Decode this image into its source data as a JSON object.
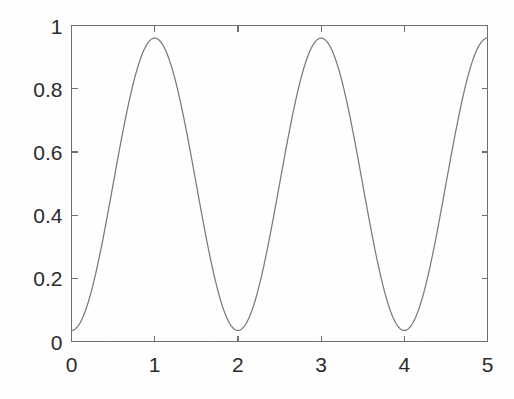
{
  "figure": {
    "background_color": "#fefefe",
    "axes_color": "#6f6f6f",
    "curve_color": "#7a7a7a",
    "label_color": "#2b2b2b"
  },
  "chart_data": {
    "type": "line",
    "title": "",
    "subtitle": "",
    "xlabel": "",
    "ylabel": "",
    "xlim": [
      0,
      5
    ],
    "ylim": [
      0,
      1
    ],
    "grid": false,
    "legend": null,
    "xticks": [
      0,
      1,
      2,
      3,
      4,
      5
    ],
    "xticklabels": [
      "0",
      "1",
      "2",
      "3",
      "4",
      "5"
    ],
    "yticks": [
      0,
      0.2,
      0.4,
      0.6,
      0.8,
      1
    ],
    "yticklabels": [
      "0",
      "0.2",
      "0.4",
      "0.6",
      "0.8",
      "1"
    ],
    "series": [
      {
        "name": "waveform",
        "color": "#7a7a7a",
        "linewidth": 1,
        "formula": "0.4975 - 0.4625*cos(pi*x)",
        "x": [
          0,
          0.1,
          0.2,
          0.3,
          0.4,
          0.5,
          0.6,
          0.7,
          0.8,
          0.9,
          1,
          1.1,
          1.2,
          1.3,
          1.4,
          1.5,
          1.6,
          1.7,
          1.8,
          1.9,
          2,
          2.1,
          2.2,
          2.3,
          2.4,
          2.5,
          2.6,
          2.7,
          2.8,
          2.9,
          3,
          3.1,
          3.2,
          3.3,
          3.4,
          3.5,
          3.6,
          3.7,
          3.8,
          3.9,
          4,
          4.1,
          4.2,
          4.3,
          4.4,
          4.5,
          4.6,
          4.7,
          4.8,
          4.9,
          5
        ],
        "y": [
          0.035,
          0.058,
          0.126,
          0.234,
          0.354,
          0.498,
          0.641,
          0.761,
          0.869,
          0.937,
          0.96,
          0.937,
          0.869,
          0.761,
          0.641,
          0.498,
          0.354,
          0.234,
          0.126,
          0.058,
          0.035,
          0.058,
          0.126,
          0.234,
          0.354,
          0.498,
          0.641,
          0.761,
          0.869,
          0.937,
          0.96,
          0.937,
          0.869,
          0.761,
          0.641,
          0.498,
          0.354,
          0.234,
          0.126,
          0.058,
          0.035,
          0.058,
          0.126,
          0.234,
          0.354,
          0.498,
          0.641,
          0.761,
          0.869,
          0.937,
          0.96
        ]
      }
    ],
    "maxima": [
      {
        "x": 1,
        "y": 0.96
      },
      {
        "x": 3,
        "y": 0.96
      },
      {
        "x": 5,
        "y": 0.96
      }
    ],
    "minima": [
      {
        "x": 0,
        "y": 0.035
      },
      {
        "x": 2,
        "y": 0.035
      },
      {
        "x": 4,
        "y": 0.035
      }
    ]
  }
}
